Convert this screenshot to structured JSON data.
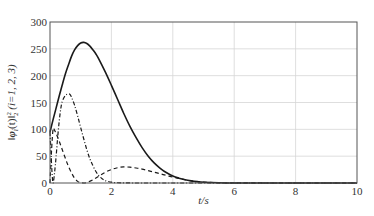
{
  "chart_data": {
    "type": "line",
    "title": "",
    "xlabel": "t/s",
    "ylabel": "||φ_i(t)||_2^2 (i=1, 2, 3)",
    "ylabel_parts": {
      "norm": "‖",
      "phi": "φ",
      "sub": "i",
      "arg": "(t)",
      "norm2": "‖",
      "pow": "2",
      "low": "2",
      "tail": " (i=1, 2, 3)"
    },
    "xlim": [
      0,
      10
    ],
    "ylim": [
      0,
      300
    ],
    "xticks": [
      0,
      2,
      4,
      6,
      8,
      10
    ],
    "yticks": [
      0,
      50,
      100,
      150,
      200,
      250,
      300
    ],
    "grid": true,
    "legend": null,
    "series": [
      {
        "name": "i=1",
        "style": "solid",
        "x": [
          0,
          0.1,
          0.2,
          0.3,
          0.4,
          0.5,
          0.6,
          0.7,
          0.8,
          0.9,
          1.0,
          1.1,
          1.2,
          1.3,
          1.4,
          1.5,
          1.6,
          1.8,
          2.0,
          2.2,
          2.4,
          2.6,
          2.8,
          3.0,
          3.2,
          3.4,
          3.6,
          3.8,
          4.0,
          4.2,
          4.4,
          4.6,
          4.8,
          5.0,
          5.5,
          6.0,
          7.0,
          8.0,
          9.0,
          10.0
        ],
        "y": [
          95,
          118,
          140,
          162,
          183,
          203,
          220,
          236,
          248,
          256,
          261,
          262,
          260,
          255,
          248,
          240,
          230,
          207,
          182,
          156,
          130,
          106,
          85,
          66,
          50,
          37,
          27,
          19,
          13,
          9,
          6,
          4,
          2.5,
          1.5,
          0.5,
          0.1,
          0,
          0,
          0,
          0
        ]
      },
      {
        "name": "i=2",
        "style": "dashdot",
        "x": [
          0,
          0.03,
          0.06,
          0.1,
          0.15,
          0.2,
          0.25,
          0.3,
          0.35,
          0.4,
          0.5,
          0.6,
          0.65,
          0.7,
          0.8,
          0.9,
          1.0,
          1.1,
          1.2,
          1.3,
          1.4,
          1.5,
          1.6,
          1.7,
          1.8,
          2.0,
          2.2,
          2.5,
          3.0,
          4.0,
          5.0,
          6.0,
          10.0
        ],
        "y": [
          95,
          60,
          25,
          0,
          20,
          50,
          85,
          115,
          138,
          152,
          163,
          166,
          165,
          160,
          145,
          125,
          103,
          82,
          62,
          45,
          32,
          21,
          13,
          8,
          4.5,
          1.5,
          0.5,
          0.1,
          0,
          0,
          0,
          0,
          0
        ]
      },
      {
        "name": "i=3",
        "style": "dashed",
        "x": [
          0,
          0.05,
          0.1,
          0.15,
          0.2,
          0.3,
          0.4,
          0.5,
          0.6,
          0.7,
          0.8,
          0.9,
          1.0,
          1.1,
          1.2,
          1.4,
          1.6,
          1.8,
          2.0,
          2.2,
          2.4,
          2.6,
          2.8,
          3.0,
          3.2,
          3.4,
          3.6,
          3.8,
          4.0,
          4.2,
          4.4,
          4.6,
          4.8,
          5.0,
          5.5,
          6.0,
          10.0
        ],
        "y": [
          0,
          60,
          100,
          98,
          92,
          78,
          62,
          46,
          31,
          19,
          9,
          3,
          0.5,
          0,
          1,
          6,
          13,
          20,
          25,
          28.5,
          30,
          29.5,
          28,
          26,
          23,
          20,
          17,
          14,
          11,
          8.5,
          6,
          4,
          2.5,
          1.5,
          0.5,
          0.1,
          0
        ]
      }
    ]
  }
}
